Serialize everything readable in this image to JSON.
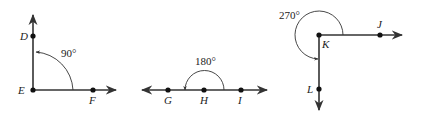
{
  "figures": [
    {
      "name": "right-angle",
      "vertex": "E",
      "points": {
        "D": "D",
        "E": "E",
        "F": "F"
      },
      "angle_label": "90°",
      "angle_degrees": 90
    },
    {
      "name": "straight-angle",
      "vertex": "H",
      "points": {
        "G": "G",
        "H": "H",
        "I": "I"
      },
      "angle_label": "180°",
      "angle_degrees": 180
    },
    {
      "name": "reflex-angle",
      "vertex": "K",
      "points": {
        "J": "J",
        "K": "K",
        "L": "L"
      },
      "angle_label": "270°",
      "angle_degrees": 270
    }
  ],
  "colors": {
    "stroke": "#333333",
    "background": "#ffffff"
  }
}
